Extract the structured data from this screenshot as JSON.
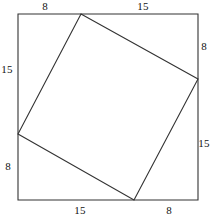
{
  "figure": {
    "canvas": {
      "width": 212,
      "height": 217
    },
    "stroke_color": "#333333",
    "background_color": "#ffffff",
    "outer_square": {
      "name": "outer-square",
      "top_left": {
        "x": 18,
        "y": 14
      },
      "top_right": {
        "x": 198,
        "y": 14
      },
      "bottom_right": {
        "x": 198,
        "y": 200
      },
      "bottom_left": {
        "x": 18,
        "y": 200
      }
    },
    "inner_square": {
      "name": "inner-square",
      "top_vertex": {
        "x": 81,
        "y": 14
      },
      "right_vertex": {
        "x": 198,
        "y": 79
      },
      "bottom_vertex": {
        "x": 134,
        "y": 200
      },
      "left_vertex": {
        "x": 18,
        "y": 134
      }
    },
    "labels": [
      {
        "id": "top-left-8",
        "text": "8",
        "x": 45,
        "y": 6,
        "side": "top",
        "segment": "left"
      },
      {
        "id": "top-right-15",
        "text": "15",
        "x": 143,
        "y": 6,
        "side": "top",
        "segment": "right"
      },
      {
        "id": "right-top-8",
        "text": "8",
        "x": 204,
        "y": 46,
        "side": "right",
        "segment": "top"
      },
      {
        "id": "right-bottom-15",
        "text": "15",
        "x": 204,
        "y": 143,
        "side": "right",
        "segment": "bottom"
      },
      {
        "id": "bottom-left-15",
        "text": "15",
        "x": 80,
        "y": 210,
        "side": "bottom",
        "segment": "left"
      },
      {
        "id": "bottom-right-8",
        "text": "8",
        "x": 169,
        "y": 210,
        "side": "bottom",
        "segment": "right"
      },
      {
        "id": "left-top-15",
        "text": "15",
        "x": 7,
        "y": 69,
        "side": "left",
        "segment": "top"
      },
      {
        "id": "left-bottom-8",
        "text": "8",
        "x": 8,
        "y": 166,
        "side": "left",
        "segment": "bottom"
      }
    ]
  }
}
